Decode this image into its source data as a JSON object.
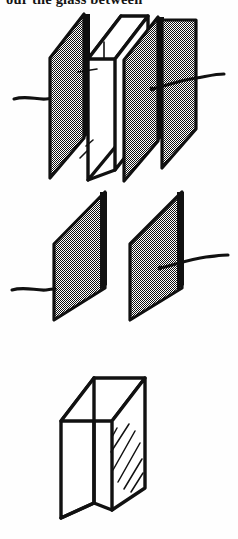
{
  "page": {
    "width": 238,
    "height": 539,
    "background_color": "#ffffff",
    "ink_color": "#111111",
    "media": "scanned black-and-white line drawing from a printed book"
  },
  "caption": {
    "text": "our the glass between",
    "note_visible": "top line of body text, clipped by the top edge of the crop"
  },
  "figure": {
    "panel_count": 3,
    "panels": [
      {
        "index": 1,
        "name": "assembled-capacitor",
        "description": "Clear rectangular glass slab sandwiched between two shaded metal plates, each plate fitted with a wavy wire lead",
        "parts": [
          {
            "name": "left-plate",
            "shading": "dither-hatch",
            "lead": "left-wire"
          },
          {
            "name": "glass-slab",
            "shading": "clear-white"
          },
          {
            "name": "right-plate",
            "shading": "dither-hatch",
            "lead": "right-wire"
          }
        ],
        "leads": 2
      },
      {
        "index": 2,
        "name": "plates-only",
        "description": "The two shaded metal plates shown separated, with the glass dielectric removed; each plate keeps its wavy wire lead",
        "parts": [
          {
            "name": "left-plate",
            "shading": "dither-hatch",
            "lead": "left-wire"
          },
          {
            "name": "right-plate",
            "shading": "dither-hatch",
            "lead": "right-wire"
          }
        ],
        "leads": 2
      },
      {
        "index": 3,
        "name": "glass-slab-only",
        "description": "The rectangular glass slab drawn alone in perspective, with diagonal shine strokes on its large face",
        "parts": [
          {
            "name": "glass-slab",
            "shading": "clear-white",
            "highlight": "diagonal-shine-strokes"
          }
        ],
        "leads": 0
      }
    ],
    "shading_legend": {
      "dither-hatch": "50% black/white checkerboard dither = metal plate",
      "clear-white": "unfilled white = transparent glass"
    }
  }
}
